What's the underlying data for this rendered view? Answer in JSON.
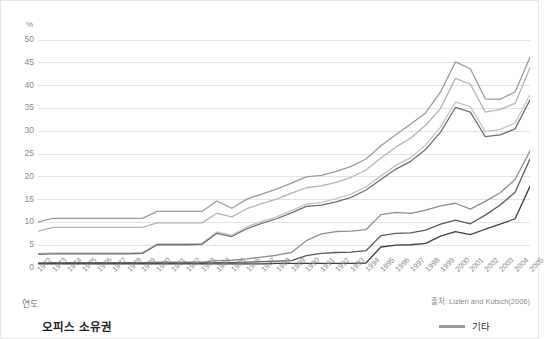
{
  "chart_data": {
    "type": "line",
    "title": "오피스 소유권",
    "subtitle": "",
    "xlabel": "연도",
    "ylabel": "%",
    "y_unit": "%",
    "source": "출처: Lizieri and Kutsch(2006)",
    "grid": true,
    "legend_position": "bottom-right",
    "xlim": [
      1972,
      2005
    ],
    "ylim": [
      0,
      50
    ],
    "yticks": [
      0,
      5,
      10,
      15,
      20,
      25,
      30,
      35,
      40,
      45,
      50
    ],
    "categories": [
      "1972",
      "1973",
      "1974",
      "1975",
      "1976",
      "1977",
      "1978",
      "1979",
      "1980",
      "1981",
      "1982",
      "1983",
      "1984",
      "1985",
      "1986",
      "1987",
      "1988",
      "1989",
      "1990",
      "1991",
      "1992",
      "1993",
      "1994",
      "1995",
      "1996",
      "1997",
      "1998",
      "1999",
      "2000",
      "2001",
      "2002",
      "2003",
      "2004",
      "2005"
    ],
    "series": [
      {
        "name": "series-1",
        "color": "#9b9b9b",
        "width": 1.3,
        "values": [
          10.1,
          10.9,
          10.9,
          10.9,
          10.9,
          10.9,
          10.9,
          10.9,
          12.4,
          12.4,
          12.4,
          12.4,
          14.7,
          13.1,
          15.1,
          16.2,
          17.3,
          18.6,
          20.0,
          20.3,
          21.2,
          22.3,
          23.9,
          26.8,
          29.2,
          31.6,
          34.0,
          38.6,
          45.2,
          43.7,
          37.1,
          37.0,
          38.6,
          46.2
        ]
      },
      {
        "name": "series-2",
        "color": "#b4b4b4",
        "width": 1.3,
        "values": [
          8.1,
          8.9,
          8.9,
          8.9,
          8.9,
          8.9,
          8.9,
          8.9,
          9.9,
          9.9,
          9.9,
          9.9,
          12.0,
          11.2,
          13.0,
          14.1,
          15.1,
          16.4,
          17.6,
          18.0,
          18.8,
          19.9,
          21.5,
          24.1,
          26.5,
          28.5,
          31.3,
          35.0,
          41.6,
          40.3,
          34.2,
          34.8,
          36.1,
          43.9
        ]
      },
      {
        "name": "series-3",
        "color": "#c4c4c4",
        "width": 1.3,
        "values": [
          3.2,
          3.3,
          3.3,
          3.3,
          3.3,
          3.3,
          3.3,
          3.4,
          5.3,
          5.3,
          5.3,
          5.4,
          7.9,
          7.2,
          9.0,
          10.2,
          11.2,
          12.6,
          14.0,
          14.4,
          15.2,
          16.2,
          17.8,
          20.2,
          22.5,
          24.2,
          27.0,
          30.9,
          36.4,
          35.4,
          29.9,
          30.4,
          31.8,
          38.0
        ]
      },
      {
        "name": "series-4",
        "color": "#6e6e6e",
        "width": 1.3,
        "values": [
          3.0,
          3.1,
          3.1,
          3.1,
          3.1,
          3.1,
          3.1,
          3.2,
          5.1,
          5.1,
          5.1,
          5.2,
          7.6,
          6.9,
          8.6,
          9.8,
          10.8,
          12.1,
          13.5,
          13.8,
          14.5,
          15.5,
          17.1,
          19.4,
          21.7,
          23.4,
          26.0,
          29.8,
          35.2,
          34.2,
          28.8,
          29.2,
          30.5,
          36.9
        ]
      },
      {
        "name": "series-5",
        "color": "#8f8f8f",
        "width": 1.3,
        "values": [
          1.1,
          1.2,
          1.2,
          1.2,
          1.2,
          1.2,
          1.2,
          1.2,
          1.3,
          1.3,
          1.3,
          1.3,
          1.6,
          1.7,
          2.0,
          2.4,
          2.8,
          3.4,
          6.0,
          7.5,
          8.0,
          8.1,
          8.4,
          11.7,
          12.2,
          12.0,
          12.7,
          13.6,
          14.2,
          12.9,
          14.6,
          16.5,
          19.4,
          25.7
        ]
      },
      {
        "name": "series-6",
        "color": "#5a5a5a",
        "width": 1.3,
        "values": [
          1.0,
          1.1,
          1.1,
          1.1,
          1.1,
          1.1,
          1.1,
          1.1,
          1.1,
          1.1,
          1.1,
          1.1,
          1.2,
          1.2,
          1.3,
          1.4,
          1.5,
          1.6,
          2.7,
          3.2,
          3.4,
          3.5,
          3.8,
          7.1,
          7.6,
          7.7,
          8.3,
          9.6,
          10.5,
          9.7,
          11.6,
          13.8,
          16.6,
          23.9
        ]
      },
      {
        "name": "series-7",
        "color": "#3f3f3f",
        "width": 1.3,
        "values": [
          0.9,
          0.9,
          0.9,
          0.9,
          0.9,
          0.9,
          0.9,
          0.9,
          0.9,
          0.9,
          0.9,
          0.9,
          0.9,
          0.9,
          0.9,
          0.9,
          1.0,
          1.0,
          1.0,
          1.0,
          1.0,
          1.0,
          1.1,
          4.6,
          5.0,
          5.1,
          5.4,
          7.0,
          8.0,
          7.3,
          8.5,
          9.6,
          10.8,
          17.9
        ]
      }
    ],
    "legend": [
      {
        "label": "기타",
        "color": "#9a9a9a"
      }
    ]
  },
  "colors": {
    "grid": "#e3e3e3",
    "tick_text": "#8a8a8a",
    "title_text": "#222222",
    "background": "#ffffff",
    "frame": "#e6e6e6"
  }
}
